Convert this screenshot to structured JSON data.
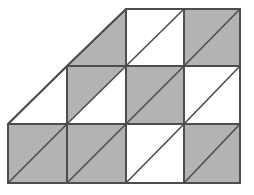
{
  "figure": {
    "type": "geometry-diagram",
    "canvas": {
      "width": 254,
      "height": 195,
      "background": "#ffffff"
    },
    "colors": {
      "shaded_fill": "#b3b3b3",
      "unshaded_fill": "#ffffff",
      "outline_stroke": "#4d4d4d",
      "diagonal_stroke": "#4d4d4d",
      "grid_stroke": "#4d4d4d"
    },
    "stroke_widths": {
      "outline": 2.0,
      "grid": 2.0,
      "diagonal": 1.6
    },
    "grid": {
      "columns": 4,
      "rows": 3,
      "x_coords": [
        8,
        67,
        126,
        184,
        240
      ],
      "y_coords": [
        9,
        66,
        124,
        183
      ],
      "cell_width": 58,
      "cell_height": 58,
      "diagonal_direction": "bottom-left-to-top-right"
    },
    "outline_points": "8,124 67,66 126,9 184,9 240,9 240,66 240,124 240,183 184,183 126,183 67,183 8,183",
    "staircase_hypotenuse": {
      "from": [
        8,
        124
      ],
      "to": [
        126,
        9
      ]
    },
    "cells": [
      {
        "id": "r0c0",
        "row": 0,
        "col": 0,
        "present": false,
        "shading": "none",
        "label": "top-row-col1-absent"
      },
      {
        "id": "r0c1",
        "row": 0,
        "col": 1,
        "present": "partial",
        "shading": "lower-right-triangle",
        "label": "top-row-col2-half-shaded"
      },
      {
        "id": "r0c2",
        "row": 0,
        "col": 2,
        "present": true,
        "shading": "none",
        "label": "top-row-col3-unshaded"
      },
      {
        "id": "r0c3",
        "row": 0,
        "col": 3,
        "present": true,
        "shading": "full",
        "label": "top-row-col4-shaded"
      },
      {
        "id": "r1c0",
        "row": 1,
        "col": 0,
        "present": "partial",
        "shading": "none",
        "label": "middle-row-col1-half-unshaded"
      },
      {
        "id": "r1c1",
        "row": 1,
        "col": 1,
        "present": true,
        "shading": "upper-left-triangle",
        "label": "middle-row-col2-upper-left-shaded"
      },
      {
        "id": "r1c2",
        "row": 1,
        "col": 2,
        "present": true,
        "shading": "full",
        "label": "middle-row-col3-shaded"
      },
      {
        "id": "r1c3",
        "row": 1,
        "col": 3,
        "present": true,
        "shading": "none",
        "label": "middle-row-col4-unshaded"
      },
      {
        "id": "r2c0",
        "row": 2,
        "col": 0,
        "present": true,
        "shading": "full",
        "label": "bottom-row-col1-shaded"
      },
      {
        "id": "r2c1",
        "row": 2,
        "col": 1,
        "present": true,
        "shading": "full",
        "label": "bottom-row-col2-shaded"
      },
      {
        "id": "r2c2",
        "row": 2,
        "col": 2,
        "present": true,
        "shading": "none",
        "label": "bottom-row-col3-unshaded"
      },
      {
        "id": "r2c3",
        "row": 2,
        "col": 3,
        "present": true,
        "shading": "full",
        "label": "bottom-row-col4-shaded"
      }
    ],
    "shaded_regions": [
      {
        "name": "top-col2-lower-right-triangle",
        "points": "67,66 126,9 126,66"
      },
      {
        "name": "top-col4-square",
        "points": "184,9 240,9 240,66 184,66"
      },
      {
        "name": "middle-col2-upper-left-triangle",
        "points": "67,66 126,66 67,124"
      },
      {
        "name": "middle-col3-square",
        "points": "126,66 184,66 184,124 126,124"
      },
      {
        "name": "bottom-col1-square",
        "points": "8,124 67,124 67,183 8,183"
      },
      {
        "name": "bottom-col2-square",
        "points": "67,124 126,124 126,183 67,183"
      },
      {
        "name": "bottom-col4-square",
        "points": "184,124 240,124 240,183 184,183"
      }
    ],
    "diagonals": [
      {
        "name": "diagonal-top-col2",
        "from": [
          67,
          66
        ],
        "to": [
          126,
          9
        ]
      },
      {
        "name": "diagonal-top-col3",
        "from": [
          126,
          66
        ],
        "to": [
          184,
          9
        ]
      },
      {
        "name": "diagonal-top-col4",
        "from": [
          184,
          66
        ],
        "to": [
          240,
          9
        ]
      },
      {
        "name": "diagonal-middle-col1",
        "from": [
          8,
          124
        ],
        "to": [
          67,
          66
        ]
      },
      {
        "name": "diagonal-middle-col2",
        "from": [
          67,
          124
        ],
        "to": [
          126,
          66
        ]
      },
      {
        "name": "diagonal-middle-col3",
        "from": [
          126,
          124
        ],
        "to": [
          184,
          66
        ]
      },
      {
        "name": "diagonal-middle-col4",
        "from": [
          184,
          124
        ],
        "to": [
          240,
          66
        ]
      },
      {
        "name": "diagonal-bottom-col1",
        "from": [
          8,
          183
        ],
        "to": [
          67,
          124
        ]
      },
      {
        "name": "diagonal-bottom-col2",
        "from": [
          67,
          183
        ],
        "to": [
          126,
          124
        ]
      },
      {
        "name": "diagonal-bottom-col3",
        "from": [
          126,
          183
        ],
        "to": [
          184,
          124
        ]
      },
      {
        "name": "diagonal-bottom-col4",
        "from": [
          184,
          183
        ],
        "to": [
          240,
          124
        ]
      }
    ],
    "grid_lines": [
      {
        "name": "grid-vline-col1-col2-middle",
        "from": [
          67,
          66
        ],
        "to": [
          67,
          183
        ]
      },
      {
        "name": "grid-vline-col2-col3",
        "from": [
          126,
          9
        ],
        "to": [
          126,
          183
        ]
      },
      {
        "name": "grid-vline-col3-col4",
        "from": [
          184,
          9
        ],
        "to": [
          184,
          183
        ]
      },
      {
        "name": "grid-hline-top-middle",
        "from": [
          67,
          66
        ],
        "to": [
          240,
          66
        ]
      },
      {
        "name": "grid-hline-middle-bottom",
        "from": [
          8,
          124
        ],
        "to": [
          240,
          124
        ]
      }
    ],
    "counts": {
      "total_unit_squares": 11,
      "fully_shaded_squares": 5,
      "half_shaded_squares": 2,
      "unshaded_squares": 4
    }
  }
}
